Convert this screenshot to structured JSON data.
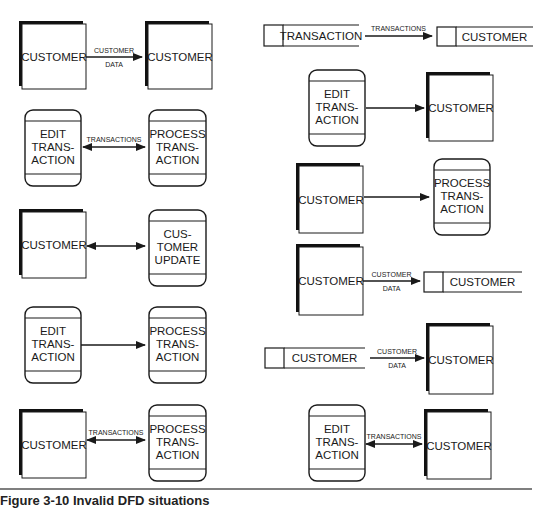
{
  "figure": {
    "caption": "Figure 3-10  Invalid DFD situations",
    "rule_color": "#555555"
  },
  "colors": {
    "stroke": "#1a1a1a",
    "fill": "#ffffff",
    "shadow": "#111111"
  },
  "left_column": [
    {
      "id": "L1",
      "from": {
        "type": "external-entity",
        "label": [
          "CUSTOMER"
        ]
      },
      "flow": {
        "direction": "right",
        "label": [
          "CUSTOMER",
          "DATA"
        ]
      },
      "to": {
        "type": "external-entity",
        "label": [
          "CUSTOMER"
        ]
      }
    },
    {
      "id": "L2",
      "from": {
        "type": "process",
        "label": [
          "EDIT",
          "TRANS-",
          "ACTION"
        ]
      },
      "flow": {
        "direction": "both",
        "label": [
          "TRANSACTIONS"
        ]
      },
      "to": {
        "type": "process",
        "label": [
          "PROCESS",
          "TRANS-",
          "ACTION"
        ]
      }
    },
    {
      "id": "L3",
      "from": {
        "type": "external-entity",
        "label": [
          "CUSTOMER"
        ]
      },
      "flow": {
        "direction": "both",
        "label": []
      },
      "to": {
        "type": "process",
        "label": [
          "CUS-",
          "TOMER",
          "UPDATE"
        ]
      }
    },
    {
      "id": "L4",
      "from": {
        "type": "process",
        "label": [
          "EDIT",
          "TRANS-",
          "ACTION"
        ]
      },
      "flow": {
        "direction": "right",
        "label": []
      },
      "to": {
        "type": "process",
        "label": [
          "PROCESS",
          "TRANS-",
          "ACTION"
        ]
      }
    },
    {
      "id": "L5",
      "from": {
        "type": "external-entity",
        "label": [
          "CUSTOMER"
        ]
      },
      "flow": {
        "direction": "both",
        "label": [
          "TRANSACTIONS"
        ]
      },
      "to": {
        "type": "process",
        "label": [
          "PROCESS",
          "TRANS-",
          "ACTION"
        ]
      }
    }
  ],
  "right_column": [
    {
      "id": "R1",
      "from": {
        "type": "data-store",
        "label": [
          "TRANSACTION"
        ]
      },
      "flow": {
        "direction": "right",
        "label": [
          "TRANSACTIONS"
        ]
      },
      "to": {
        "type": "data-store",
        "label": [
          "CUSTOMER"
        ]
      }
    },
    {
      "id": "R2",
      "from": {
        "type": "process",
        "label": [
          "EDIT",
          "TRANS-",
          "ACTION"
        ]
      },
      "flow": {
        "direction": "right",
        "label": []
      },
      "to": {
        "type": "external-entity",
        "label": [
          "CUSTOMER"
        ]
      }
    },
    {
      "id": "R3",
      "from": {
        "type": "external-entity",
        "label": [
          "CUSTOMER"
        ]
      },
      "flow": {
        "direction": "right",
        "label": []
      },
      "to": {
        "type": "process",
        "label": [
          "PROCESS",
          "TRANS-",
          "ACTION"
        ]
      }
    },
    {
      "id": "R4",
      "from": {
        "type": "external-entity",
        "label": [
          "CUSTOMER"
        ]
      },
      "flow": {
        "direction": "right",
        "label": [
          "CUSTOMER",
          "DATA"
        ]
      },
      "to": {
        "type": "data-store",
        "label": [
          "CUSTOMER"
        ]
      }
    },
    {
      "id": "R5",
      "from": {
        "type": "data-store",
        "label": [
          "CUSTOMER"
        ]
      },
      "flow": {
        "direction": "right",
        "label": [
          "CUSTOMER",
          "DATA"
        ]
      },
      "to": {
        "type": "external-entity",
        "label": [
          "CUSTOMER"
        ]
      }
    },
    {
      "id": "R6",
      "from": {
        "type": "process",
        "label": [
          "EDIT",
          "TRANS-",
          "ACTION"
        ]
      },
      "flow": {
        "direction": "both",
        "label": [
          "TRANSACTIONS"
        ]
      },
      "to": {
        "type": "external-entity",
        "label": [
          "CUSTOMER"
        ]
      }
    }
  ]
}
